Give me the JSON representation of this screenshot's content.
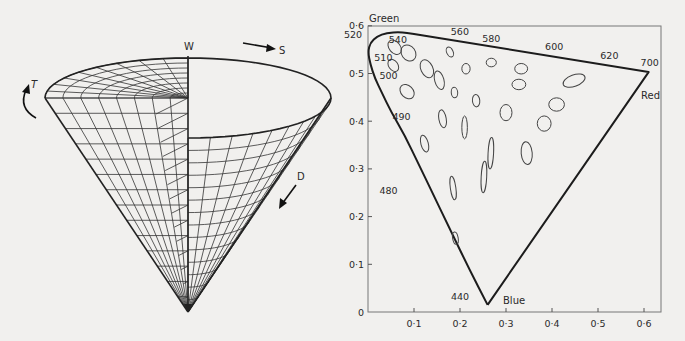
{
  "cone": {
    "labels": {
      "white": "W",
      "saturation": "S",
      "tone": "T",
      "darkness": "D"
    },
    "geometry": {
      "apex": [
        188,
        312
      ],
      "top_center": [
        188,
        56
      ],
      "top_left": [
        46,
        100
      ],
      "top_right": [
        333,
        100
      ],
      "rim_front_depth": 0,
      "radial_lines": 12,
      "rings": 14
    },
    "colors": {
      "line": "#333333",
      "edge": "#222222"
    }
  },
  "chart_data": {
    "type": "scatter",
    "title": "",
    "xlabel": "",
    "ylabel": "",
    "xlim": [
      0,
      0.63
    ],
    "ylim": [
      0,
      0.6
    ],
    "grid": false,
    "x_ticks": [
      "0·1",
      "0·2",
      "0·3",
      "0·4",
      "0·5",
      "0·6"
    ],
    "x_tick_values": [
      0.1,
      0.2,
      0.3,
      0.4,
      0.5,
      0.6
    ],
    "y_ticks": [
      "0",
      "0·1",
      "0·2",
      "0·3",
      "0·4",
      "0·5",
      "0·6"
    ],
    "y_tick_values": [
      0,
      0.1,
      0.2,
      0.3,
      0.4,
      0.5,
      0.6
    ],
    "corner_labels": {
      "green": "Green",
      "red": "Red",
      "blue": "Blue"
    },
    "spectral_locus": [
      [
        0.26,
        0.015
      ],
      [
        0.22,
        0.09
      ],
      [
        0.18,
        0.17
      ],
      [
        0.14,
        0.25
      ],
      [
        0.11,
        0.31
      ],
      [
        0.08,
        0.37
      ],
      [
        0.05,
        0.42
      ],
      [
        0.03,
        0.46
      ],
      [
        0.015,
        0.49
      ],
      [
        0.005,
        0.52
      ],
      [
        0.0,
        0.545
      ],
      [
        0.005,
        0.565
      ],
      [
        0.02,
        0.578
      ],
      [
        0.04,
        0.585
      ],
      [
        0.07,
        0.587
      ],
      [
        0.1,
        0.583
      ],
      [
        0.61,
        0.503
      ],
      [
        0.26,
        0.015
      ]
    ],
    "wavelength_labels": [
      {
        "label": "520",
        "x": 0.0,
        "y": 0.565,
        "dx": -24,
        "dy": -4
      },
      {
        "label": "510",
        "x": 0.005,
        "y": 0.527,
        "dx": 4,
        "dy": 0
      },
      {
        "label": "500",
        "x": 0.012,
        "y": 0.497,
        "dx": 6,
        "dy": 4
      },
      {
        "label": "490",
        "x": 0.04,
        "y": 0.41,
        "dx": 6,
        "dy": 4
      },
      {
        "label": "480",
        "x": 0.09,
        "y": 0.255,
        "dx": -30,
        "dy": 4
      },
      {
        "label": "540",
        "x": 0.08,
        "y": 0.585,
        "dx": -16,
        "dy": 10
      },
      {
        "label": "560",
        "x": 0.18,
        "y": 0.57,
        "dx": 0,
        "dy": -5
      },
      {
        "label": "580",
        "x": 0.27,
        "y": 0.556,
        "dx": -10,
        "dy": -5
      },
      {
        "label": "600",
        "x": 0.385,
        "y": 0.538,
        "dx": 0,
        "dy": -5
      },
      {
        "label": "620",
        "x": 0.505,
        "y": 0.52,
        "dx": 0,
        "dy": -5
      },
      {
        "label": "700",
        "x": 0.61,
        "y": 0.503,
        "dx": -8,
        "dy": -6
      },
      {
        "label": "440",
        "x": 0.25,
        "y": 0.03,
        "dx": -32,
        "dy": 2
      }
    ],
    "ellipses": [
      {
        "cx": 0.058,
        "cy": 0.555,
        "rx": 0.012,
        "ry": 0.017,
        "angle": -40
      },
      {
        "cx": 0.088,
        "cy": 0.543,
        "rx": 0.015,
        "ry": 0.018,
        "angle": -35
      },
      {
        "cx": 0.055,
        "cy": 0.517,
        "rx": 0.01,
        "ry": 0.014,
        "angle": -35
      },
      {
        "cx": 0.128,
        "cy": 0.51,
        "rx": 0.013,
        "ry": 0.02,
        "angle": -25
      },
      {
        "cx": 0.155,
        "cy": 0.486,
        "rx": 0.01,
        "ry": 0.02,
        "angle": -15
      },
      {
        "cx": 0.085,
        "cy": 0.462,
        "rx": 0.013,
        "ry": 0.017,
        "angle": -45
      },
      {
        "cx": 0.178,
        "cy": 0.545,
        "rx": 0.007,
        "ry": 0.011,
        "angle": -25
      },
      {
        "cx": 0.213,
        "cy": 0.51,
        "rx": 0.009,
        "ry": 0.011,
        "angle": 0
      },
      {
        "cx": 0.188,
        "cy": 0.46,
        "rx": 0.007,
        "ry": 0.011,
        "angle": -5
      },
      {
        "cx": 0.235,
        "cy": 0.443,
        "rx": 0.008,
        "ry": 0.013,
        "angle": -5
      },
      {
        "cx": 0.268,
        "cy": 0.523,
        "rx": 0.011,
        "ry": 0.009,
        "angle": 0
      },
      {
        "cx": 0.333,
        "cy": 0.51,
        "rx": 0.014,
        "ry": 0.011,
        "angle": 0
      },
      {
        "cx": 0.328,
        "cy": 0.477,
        "rx": 0.015,
        "ry": 0.011,
        "angle": 0
      },
      {
        "cx": 0.448,
        "cy": 0.485,
        "rx": 0.025,
        "ry": 0.012,
        "angle": -20
      },
      {
        "cx": 0.41,
        "cy": 0.435,
        "rx": 0.017,
        "ry": 0.014,
        "angle": 0
      },
      {
        "cx": 0.3,
        "cy": 0.418,
        "rx": 0.013,
        "ry": 0.017,
        "angle": 0
      },
      {
        "cx": 0.383,
        "cy": 0.395,
        "rx": 0.015,
        "ry": 0.016,
        "angle": 0
      },
      {
        "cx": 0.162,
        "cy": 0.405,
        "rx": 0.008,
        "ry": 0.019,
        "angle": -10
      },
      {
        "cx": 0.21,
        "cy": 0.387,
        "rx": 0.006,
        "ry": 0.024,
        "angle": 0
      },
      {
        "cx": 0.123,
        "cy": 0.353,
        "rx": 0.008,
        "ry": 0.018,
        "angle": -15
      },
      {
        "cx": 0.267,
        "cy": 0.333,
        "rx": 0.006,
        "ry": 0.033,
        "angle": 3
      },
      {
        "cx": 0.345,
        "cy": 0.333,
        "rx": 0.012,
        "ry": 0.024,
        "angle": -5
      },
      {
        "cx": 0.252,
        "cy": 0.283,
        "rx": 0.006,
        "ry": 0.033,
        "angle": 3
      },
      {
        "cx": 0.185,
        "cy": 0.26,
        "rx": 0.006,
        "ry": 0.025,
        "angle": -8
      },
      {
        "cx": 0.19,
        "cy": 0.155,
        "rx": 0.006,
        "ry": 0.013,
        "angle": -10
      }
    ],
    "layout": {
      "plot_left": 368,
      "plot_right": 661,
      "plot_top": 26,
      "plot_bottom": 312,
      "px_per_x": 460,
      "px_per_y": 477
    },
    "colors": {
      "locus": "#1c1c1c",
      "ellipse": "#444444",
      "frame": "#777777"
    }
  }
}
